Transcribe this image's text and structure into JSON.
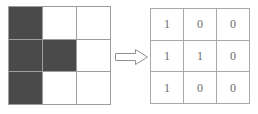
{
  "figure": {
    "name": "binary-mask-conversion-figure",
    "background_color": "#ffffff"
  },
  "pixel_grid": {
    "name": "shaded-3x3-grid",
    "rows": 3,
    "columns": 3,
    "shaded_color": "#4a4a4a",
    "empty_color": "#ffffff",
    "gridline_color": "#9d9d9d",
    "cells": [
      [
        1,
        0,
        0
      ],
      [
        1,
        1,
        0
      ],
      [
        1,
        0,
        0
      ]
    ]
  },
  "arrow": {
    "name": "right-arrow-icon",
    "direction": "right",
    "style": "hollow-outline",
    "stroke_color": "#8f8f8f",
    "fill_color": "#ffffff"
  },
  "value_grid": {
    "name": "binary-value-3x3-grid",
    "rows": 3,
    "columns": 3,
    "gridline_color": "#a8a8a8",
    "text_color": "#6b6b6b",
    "values": [
      [
        "1",
        "0",
        "0"
      ],
      [
        "1",
        "1",
        "0"
      ],
      [
        "1",
        "0",
        "0"
      ]
    ]
  }
}
